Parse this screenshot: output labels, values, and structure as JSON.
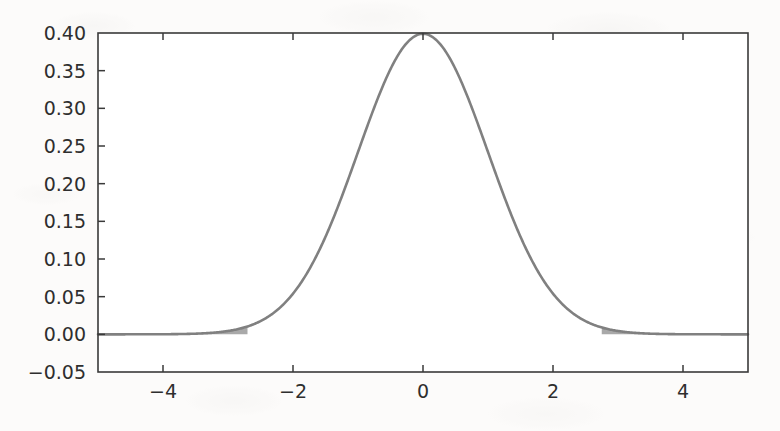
{
  "figure": {
    "background_color": "#fcfbfa",
    "plot_background_color": "#ffffff"
  },
  "chart_data": {
    "type": "line",
    "title": "",
    "subtitle": "",
    "xlabel": "",
    "ylabel": "",
    "xlim": [
      -5,
      5
    ],
    "ylim": [
      -0.05,
      0.4
    ],
    "grid": false,
    "legend": null,
    "legend_position": "none",
    "curve_color": "#808080",
    "axis_color": "#3a3a3a",
    "shade_color": "#9a9a9a",
    "xticks": [
      -4,
      -2,
      0,
      2,
      4
    ],
    "xtick_labels": [
      "−4",
      "−2",
      "0",
      "2",
      "4"
    ],
    "yticks": [
      -0.05,
      0.0,
      0.05,
      0.1,
      0.15,
      0.2,
      0.25,
      0.3,
      0.35,
      0.4
    ],
    "ytick_labels": [
      "−0.05",
      "0.00",
      "0.05",
      "0.10",
      "0.15",
      "0.20",
      "0.25",
      "0.30",
      "0.35",
      "0.40"
    ],
    "series": [
      {
        "name": "standard normal pdf",
        "description": "Normal density curve, mean 0, standard deviation 1",
        "mean": 0,
        "sd": 1,
        "peak_value": 0.3989,
        "peak_x": 0,
        "x": [
          -5.0,
          -4.75,
          -4.5,
          -4.25,
          -4.0,
          -3.75,
          -3.5,
          -3.25,
          -3.0,
          -2.75,
          -2.5,
          -2.25,
          -2.0,
          -1.75,
          -1.5,
          -1.25,
          -1.0,
          -0.75,
          -0.5,
          -0.25,
          0.0,
          0.25,
          0.5,
          0.75,
          1.0,
          1.25,
          1.5,
          1.75,
          2.0,
          2.25,
          2.5,
          2.75,
          3.0,
          3.25,
          3.5,
          3.75,
          4.0,
          4.25,
          4.5,
          4.75,
          5.0
        ],
        "y": [
          0.0,
          0.0,
          0.0,
          0.0001,
          0.0001,
          0.0004,
          0.0009,
          0.002,
          0.0044,
          0.0091,
          0.0175,
          0.0317,
          0.054,
          0.0863,
          0.1295,
          0.1826,
          0.242,
          0.3011,
          0.3521,
          0.3867,
          0.3989,
          0.3867,
          0.3521,
          0.3011,
          0.242,
          0.1826,
          0.1295,
          0.0863,
          0.054,
          0.0317,
          0.0175,
          0.0091,
          0.0044,
          0.002,
          0.0009,
          0.0004,
          0.0001,
          0.0001,
          0.0,
          0.0,
          0.0
        ]
      }
    ],
    "shaded_regions": [
      {
        "name": "left-tail-rejection-region",
        "from": -5.0,
        "to": -2.7,
        "fill": "#9a9a9a",
        "label": ""
      },
      {
        "name": "right-tail-rejection-region",
        "from": 2.75,
        "to": 5.0,
        "fill": "#9a9a9a",
        "label": ""
      }
    ],
    "annotations": []
  }
}
